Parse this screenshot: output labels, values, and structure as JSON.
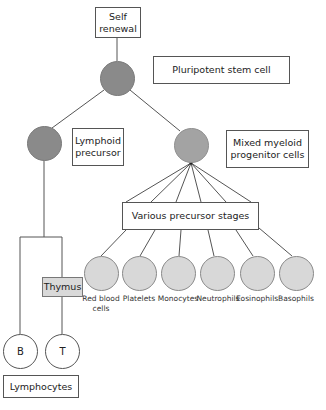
{
  "nodes": {
    "self_renewal": "Self renewal",
    "self_renewal_lines": [
      "Self",
      "renewal"
    ],
    "pluripotent": "Pluripotent stem cell",
    "lymphoid": [
      "Lymphoid",
      "precursor"
    ],
    "myeloid": [
      "Mixed myeloid",
      "progenitor cells"
    ],
    "precursor_stages": "Various precursor stages",
    "thymus": "Thymus",
    "b_cell": "B",
    "t_cell": "T",
    "lymphocytes": "Lymphocytes"
  },
  "myeloid_cells": [
    {
      "label": "Red blood",
      "label2": "cells"
    },
    {
      "label": "Platelets",
      "label2": ""
    },
    {
      "label": "Monocytes",
      "label2": ""
    },
    {
      "label": "Neutrophils",
      "label2": ""
    },
    {
      "label": "Eosinophils",
      "label2": ""
    },
    {
      "label": "Basophils",
      "label2": ""
    }
  ],
  "colors": {
    "stem_cell": "#8a8a8a",
    "lymphoid_cell": "#8a8a8a",
    "myeloid_cell": "#a3a3a3",
    "mature_cell": "#d8d8d8",
    "thymus_fill": "#d9d9d9",
    "line": "#555555"
  }
}
